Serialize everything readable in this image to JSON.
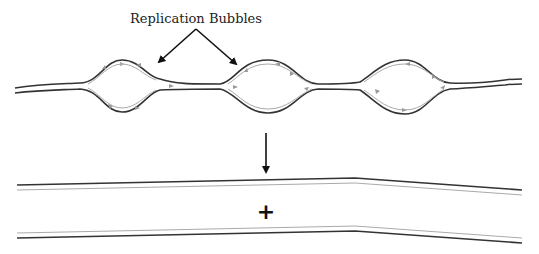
{
  "diagram": {
    "title_label": "Replication Bubbles",
    "plus_symbol": "+",
    "bubble_count": 3,
    "colors": {
      "parental_strand": "#333333",
      "new_strand": "#aaaaaa",
      "arrow": "#111111"
    },
    "parts": [
      {
        "name": "replicating-dna",
        "description": "DNA with three replication bubbles"
      },
      {
        "name": "daughter-dna-1",
        "description": "first daughter double helix"
      },
      {
        "name": "daughter-dna-2",
        "description": "second daughter double helix"
      }
    ]
  }
}
